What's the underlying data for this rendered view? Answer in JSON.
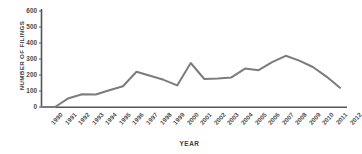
{
  "chart_data": {
    "type": "line",
    "title": "",
    "xlabel": "YEAR",
    "ylabel": "NUMBER OF FILINGS",
    "ylim": [
      0,
      600
    ],
    "yticks": [
      0,
      100,
      200,
      300,
      400,
      500,
      600
    ],
    "grid": false,
    "legend": null,
    "line_color": "#7c7c7c",
    "axis_color": "#555555",
    "categories": [
      "1990",
      "1991",
      "1992",
      "1993",
      "1994",
      "1995",
      "1996",
      "1997",
      "1998",
      "1999",
      "2000",
      "2001",
      "2002",
      "2003",
      "2004",
      "2005",
      "2006",
      "2007",
      "2008",
      "2009",
      "2010",
      "2011",
      "2012"
    ],
    "values": [
      0,
      0,
      55,
      80,
      78,
      105,
      130,
      220,
      195,
      170,
      135,
      275,
      175,
      178,
      185,
      240,
      230,
      280,
      320,
      290,
      250,
      190,
      120
    ],
    "series": [
      {
        "name": "Number of filings",
        "values": [
          0,
          0,
          55,
          80,
          78,
          105,
          130,
          220,
          195,
          170,
          135,
          275,
          175,
          178,
          185,
          240,
          230,
          280,
          320,
          290,
          250,
          190,
          120
        ]
      }
    ]
  },
  "axes": {
    "y_title": "NUMBER OF FILINGS",
    "x_title": "YEAR",
    "y_ticks": [
      "600",
      "500",
      "400",
      "300",
      "200",
      "100",
      "0"
    ],
    "x_ticks": [
      "1990",
      "1991",
      "1992",
      "1993",
      "1994",
      "1995",
      "1996",
      "1997",
      "1998",
      "1999",
      "2000",
      "2001",
      "2002",
      "2003",
      "2004",
      "2005",
      "2006",
      "2007",
      "2008",
      "2009",
      "2010",
      "2011",
      "2012"
    ]
  }
}
